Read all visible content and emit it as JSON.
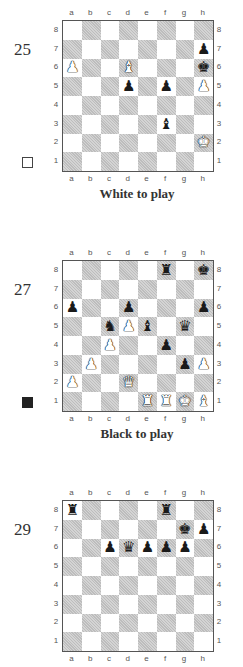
{
  "files": [
    "a",
    "b",
    "c",
    "d",
    "e",
    "f",
    "g",
    "h"
  ],
  "ranks": [
    "8",
    "7",
    "6",
    "5",
    "4",
    "3",
    "2",
    "1"
  ],
  "pieces_glyphs": {
    "K": "♚",
    "Q": "♛",
    "R": "♜",
    "B": "♝",
    "N": "♞",
    "P": "♟"
  },
  "diagrams": [
    {
      "number": "25",
      "to_move": "white",
      "caption": "White to play",
      "pieces": [
        {
          "sq": "a6",
          "color": "w",
          "type": "P"
        },
        {
          "sq": "d6",
          "color": "w",
          "type": "B"
        },
        {
          "sq": "h7",
          "color": "b",
          "type": "P"
        },
        {
          "sq": "h6",
          "color": "b",
          "type": "K"
        },
        {
          "sq": "d5",
          "color": "b",
          "type": "P"
        },
        {
          "sq": "f5",
          "color": "b",
          "type": "P"
        },
        {
          "sq": "h5",
          "color": "w",
          "type": "P"
        },
        {
          "sq": "f3",
          "color": "b",
          "type": "B"
        },
        {
          "sq": "h2",
          "color": "w",
          "type": "K"
        }
      ]
    },
    {
      "number": "27",
      "to_move": "black",
      "caption": "Black to play",
      "pieces": [
        {
          "sq": "f8",
          "color": "b",
          "type": "R"
        },
        {
          "sq": "h8",
          "color": "b",
          "type": "K"
        },
        {
          "sq": "a6",
          "color": "b",
          "type": "P"
        },
        {
          "sq": "d6",
          "color": "b",
          "type": "P"
        },
        {
          "sq": "h6",
          "color": "b",
          "type": "P"
        },
        {
          "sq": "c5",
          "color": "b",
          "type": "N"
        },
        {
          "sq": "d5",
          "color": "w",
          "type": "P"
        },
        {
          "sq": "e5",
          "color": "b",
          "type": "B"
        },
        {
          "sq": "g5",
          "color": "b",
          "type": "Q"
        },
        {
          "sq": "c4",
          "color": "w",
          "type": "P"
        },
        {
          "sq": "f4",
          "color": "b",
          "type": "P"
        },
        {
          "sq": "b3",
          "color": "w",
          "type": "P"
        },
        {
          "sq": "g3",
          "color": "b",
          "type": "P"
        },
        {
          "sq": "h3",
          "color": "w",
          "type": "P"
        },
        {
          "sq": "a2",
          "color": "w",
          "type": "P"
        },
        {
          "sq": "d2",
          "color": "w",
          "type": "Q"
        },
        {
          "sq": "e1",
          "color": "w",
          "type": "R"
        },
        {
          "sq": "f1",
          "color": "w",
          "type": "R"
        },
        {
          "sq": "g1",
          "color": "w",
          "type": "K"
        },
        {
          "sq": "h1",
          "color": "w",
          "type": "B"
        }
      ]
    },
    {
      "number": "29",
      "to_move": "",
      "caption": "",
      "pieces": [
        {
          "sq": "a8",
          "color": "b",
          "type": "R"
        },
        {
          "sq": "f8",
          "color": "b",
          "type": "R"
        },
        {
          "sq": "g7",
          "color": "b",
          "type": "K"
        },
        {
          "sq": "h7",
          "color": "b",
          "type": "P"
        },
        {
          "sq": "c6",
          "color": "b",
          "type": "P"
        },
        {
          "sq": "d6",
          "color": "b",
          "type": "Q"
        },
        {
          "sq": "e6",
          "color": "b",
          "type": "P"
        },
        {
          "sq": "f6",
          "color": "b",
          "type": "P"
        },
        {
          "sq": "g6",
          "color": "b",
          "type": "P"
        }
      ]
    }
  ]
}
